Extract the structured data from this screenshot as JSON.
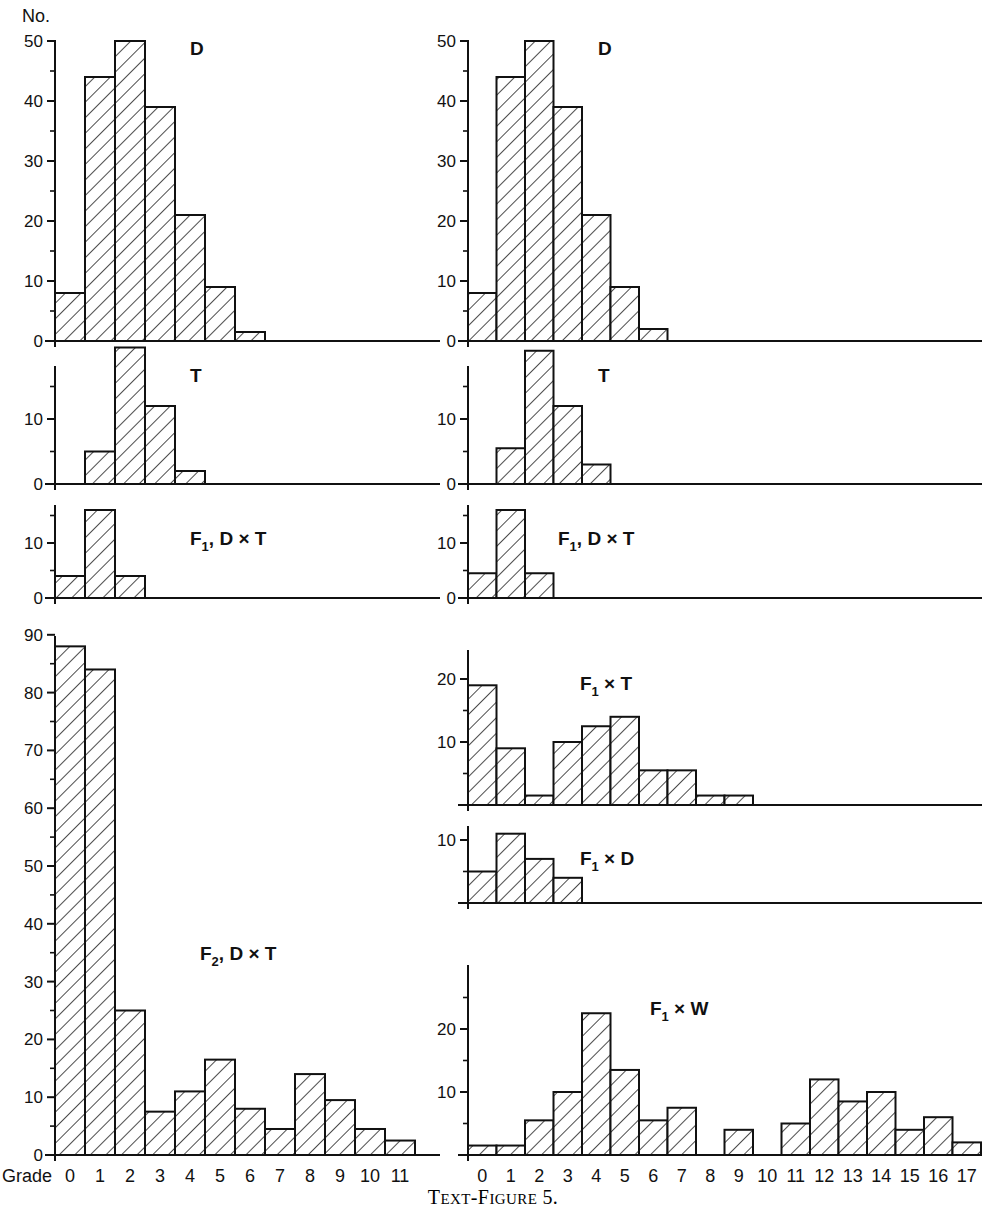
{
  "figure": {
    "caption_prefix": "T",
    "caption_small": "EXT-FIGURE",
    "caption_number": "5.",
    "caption_full": "TEXT-FIGURE 5.",
    "y_axis_title": "No.",
    "x_axis_title": "Grade",
    "ink_color": "#111111",
    "background": "#ffffff"
  },
  "left_column": {
    "x_ticks": [
      "0",
      "1",
      "2",
      "3",
      "4",
      "5",
      "6",
      "7",
      "8",
      "9",
      "10",
      "11"
    ]
  },
  "right_column": {
    "x_ticks": [
      "0",
      "1",
      "2",
      "3",
      "4",
      "5",
      "6",
      "7",
      "8",
      "9",
      "10",
      "11",
      "12",
      "13",
      "14",
      "15",
      "16",
      "17"
    ]
  },
  "chart_data": [
    {
      "id": "left-D",
      "type": "bar",
      "title": "D",
      "column": "left",
      "xlabel": "Grade",
      "ylabel": "No.",
      "categories": [
        0,
        1,
        2,
        3,
        4,
        5,
        6,
        7,
        8,
        9,
        10,
        11
      ],
      "values": [
        8,
        44,
        50,
        39,
        21,
        9,
        1.5,
        0,
        0,
        0,
        0,
        0
      ],
      "ylim": [
        0,
        52
      ],
      "y_major_ticks": [
        0,
        10,
        20,
        30,
        40,
        50
      ],
      "y_minor_ticks": [
        5,
        15,
        25,
        35,
        45
      ],
      "y_tick_labels": [
        "0",
        "10",
        "20",
        "30",
        "40",
        "50"
      ],
      "grid": false
    },
    {
      "id": "left-T",
      "type": "bar",
      "title": "T",
      "column": "left",
      "xlabel": "Grade",
      "ylabel": "No.",
      "categories": [
        0,
        1,
        2,
        3,
        4,
        5,
        6,
        7,
        8,
        9,
        10,
        11
      ],
      "values": [
        0,
        5,
        21,
        12,
        2,
        0,
        0,
        0,
        0,
        0,
        0,
        0
      ],
      "ylim": [
        0,
        22
      ],
      "y_major_ticks": [
        0,
        10,
        20
      ],
      "y_minor_ticks": [
        5,
        15
      ],
      "y_tick_labels": [
        "0",
        "10",
        "20"
      ],
      "grid": false
    },
    {
      "id": "left-F1-DxT",
      "type": "bar",
      "title": "F₁, D × T",
      "title_parts": {
        "base": "F",
        "sub": "1",
        "rest": ", D × T"
      },
      "column": "left",
      "xlabel": "Grade",
      "ylabel": "No.",
      "categories": [
        0,
        1,
        2,
        3,
        4,
        5,
        6,
        7,
        8,
        9,
        10,
        11
      ],
      "values": [
        4,
        16,
        4,
        0,
        0,
        0,
        0,
        0,
        0,
        0,
        0,
        0
      ],
      "ylim": [
        0,
        17
      ],
      "y_major_ticks": [
        0,
        10
      ],
      "y_minor_ticks": [
        5,
        15
      ],
      "y_tick_labels": [
        "0",
        "10"
      ],
      "grid": false
    },
    {
      "id": "left-F2-DxT",
      "type": "bar",
      "title": "F₂, D × T",
      "title_parts": {
        "base": "F",
        "sub": "2",
        "rest": ", D × T"
      },
      "column": "left",
      "xlabel": "Grade",
      "ylabel": "No.",
      "categories": [
        0,
        1,
        2,
        3,
        4,
        5,
        6,
        7,
        8,
        9,
        10,
        11
      ],
      "values": [
        88,
        84,
        25,
        7.5,
        11,
        16.5,
        8,
        4.5,
        14,
        9.5,
        4.5,
        2.5
      ],
      "ylim": [
        0,
        92
      ],
      "y_major_ticks": [
        0,
        10,
        20,
        30,
        40,
        50,
        60,
        70,
        80,
        90
      ],
      "y_minor_ticks": [
        5,
        15,
        25,
        35,
        45,
        55,
        65,
        75,
        85
      ],
      "y_tick_labels": [
        "0",
        "10",
        "20",
        "30",
        "40",
        "50",
        "60",
        "70",
        "80",
        "90"
      ],
      "grid": false
    },
    {
      "id": "right-D",
      "type": "bar",
      "title": "D",
      "column": "right",
      "xlabel": "Grade",
      "ylabel": "No.",
      "categories": [
        0,
        1,
        2,
        3,
        4,
        5,
        6,
        7,
        8,
        9,
        10,
        11,
        12,
        13,
        14,
        15,
        16,
        17
      ],
      "values": [
        8,
        44,
        50,
        39,
        21,
        9,
        2,
        0,
        0,
        0,
        0,
        0,
        0,
        0,
        0,
        0,
        0,
        0
      ],
      "ylim": [
        0,
        52
      ],
      "y_major_ticks": [
        0,
        10,
        20,
        30,
        40,
        50
      ],
      "y_minor_ticks": [
        5,
        15,
        25,
        35,
        45
      ],
      "y_tick_labels": [
        "0",
        "10",
        "20",
        "30",
        "40",
        "50"
      ],
      "grid": false
    },
    {
      "id": "right-T",
      "type": "bar",
      "title": "T",
      "column": "right",
      "xlabel": "Grade",
      "ylabel": "No.",
      "categories": [
        0,
        1,
        2,
        3,
        4,
        5,
        6,
        7,
        8,
        9,
        10,
        11,
        12,
        13,
        14,
        15,
        16,
        17
      ],
      "values": [
        0,
        5.5,
        20.5,
        12,
        3,
        0,
        0,
        0,
        0,
        0,
        0,
        0,
        0,
        0,
        0,
        0,
        0,
        0
      ],
      "ylim": [
        0,
        22
      ],
      "y_major_ticks": [
        0,
        10,
        20
      ],
      "y_minor_ticks": [
        5,
        15
      ],
      "y_tick_labels": [
        "0",
        "10",
        "20"
      ],
      "grid": false
    },
    {
      "id": "right-F1-DxT",
      "type": "bar",
      "title": "F₁, D × T",
      "title_parts": {
        "base": "F",
        "sub": "1",
        "rest": ", D × T"
      },
      "column": "right",
      "xlabel": "Grade",
      "ylabel": "No.",
      "categories": [
        0,
        1,
        2,
        3,
        4,
        5,
        6,
        7,
        8,
        9,
        10,
        11,
        12,
        13,
        14,
        15,
        16,
        17
      ],
      "values": [
        4.5,
        16,
        4.5,
        0,
        0,
        0,
        0,
        0,
        0,
        0,
        0,
        0,
        0,
        0,
        0,
        0,
        0,
        0
      ],
      "ylim": [
        0,
        17
      ],
      "y_major_ticks": [
        0,
        10
      ],
      "y_minor_ticks": [
        5,
        15
      ],
      "y_tick_labels": [
        "0",
        "10"
      ],
      "grid": false
    },
    {
      "id": "right-F1-xT",
      "type": "bar",
      "title": "F₁ × T",
      "title_parts": {
        "base": "F",
        "sub": "1",
        "rest": " × T"
      },
      "column": "right",
      "xlabel": "Grade",
      "ylabel": "No.",
      "categories": [
        0,
        1,
        2,
        3,
        4,
        5,
        6,
        7,
        8,
        9,
        10,
        11,
        12,
        13,
        14,
        15,
        16,
        17
      ],
      "values": [
        19,
        9,
        1.5,
        10,
        12.5,
        14,
        5.5,
        5.5,
        1.5,
        1.5,
        0,
        0,
        0,
        0,
        0,
        0,
        0,
        0
      ],
      "ylim": [
        0,
        22
      ],
      "y_major_ticks": [
        10,
        20
      ],
      "y_minor_ticks": [
        5,
        15
      ],
      "y_tick_labels": [
        "10",
        "20"
      ],
      "grid": false
    },
    {
      "id": "right-F1-xD",
      "type": "bar",
      "title": "F₁ × D",
      "title_parts": {
        "base": "F",
        "sub": "1",
        "rest": " × D"
      },
      "column": "right",
      "xlabel": "Grade",
      "ylabel": "No.",
      "categories": [
        0,
        1,
        2,
        3,
        4,
        5,
        6,
        7,
        8,
        9,
        10,
        11,
        12,
        13,
        14,
        15,
        16,
        17
      ],
      "values": [
        5,
        11,
        7,
        4,
        0,
        0,
        0,
        0,
        0,
        0,
        0,
        0,
        0,
        0,
        0,
        0,
        0,
        0
      ],
      "ylim": [
        0,
        14
      ],
      "y_major_ticks": [
        10
      ],
      "y_minor_ticks": [
        5
      ],
      "y_tick_labels": [
        "10"
      ],
      "grid": false
    },
    {
      "id": "right-F1-xW",
      "type": "bar",
      "title": "F₁ × W",
      "title_parts": {
        "base": "F",
        "sub": "1",
        "rest": " × W"
      },
      "column": "right",
      "xlabel": "Grade",
      "ylabel": "No.",
      "categories": [
        0,
        1,
        2,
        3,
        4,
        5,
        6,
        7,
        8,
        9,
        10,
        11,
        12,
        13,
        14,
        15,
        16,
        17
      ],
      "values": [
        1.5,
        1.5,
        5.5,
        10,
        22.5,
        13.5,
        5.5,
        7.5,
        0,
        4,
        0,
        5,
        12,
        8.5,
        10,
        4,
        6,
        2
      ],
      "ylim": [
        0,
        26
      ],
      "y_major_ticks": [
        10,
        20
      ],
      "y_minor_ticks": [
        5,
        15,
        25
      ],
      "y_tick_labels": [
        "10",
        "20"
      ],
      "grid": false
    }
  ]
}
